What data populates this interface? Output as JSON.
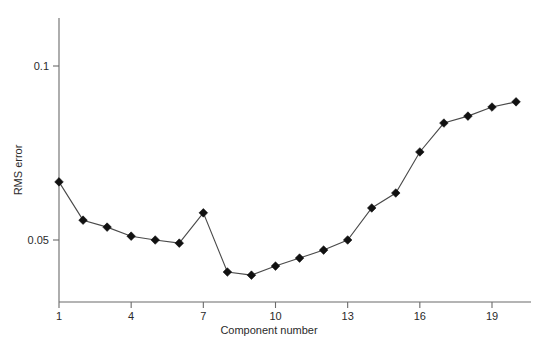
{
  "chart_data": {
    "type": "line",
    "title": "",
    "subtitle": "",
    "xlabel": "Component number",
    "ylabel": "RMS error",
    "x": [
      1,
      2,
      3,
      4,
      5,
      6,
      7,
      8,
      9,
      10,
      11,
      12,
      13,
      14,
      15,
      16,
      17,
      18,
      19,
      20
    ],
    "values": [
      0.0667,
      0.0557,
      0.0537,
      0.0511,
      0.05,
      0.0491,
      0.0578,
      0.0408,
      0.0399,
      0.0425,
      0.0448,
      0.0471,
      0.05,
      0.0592,
      0.0635,
      0.0753,
      0.0836,
      0.0856,
      0.0882,
      0.0897
    ],
    "series": [
      {
        "name": "RMS error",
        "values": [
          0.0667,
          0.0557,
          0.0537,
          0.0511,
          0.05,
          0.0491,
          0.0578,
          0.0408,
          0.0399,
          0.0425,
          0.0448,
          0.0471,
          0.05,
          0.0592,
          0.0635,
          0.0753,
          0.0836,
          0.0856,
          0.0882,
          0.0897
        ],
        "marker": "diamond",
        "color": "#111111"
      }
    ],
    "xticks": [
      1,
      4,
      7,
      10,
      13,
      16,
      19
    ],
    "xtick_labels": [
      "1",
      "4",
      "7",
      "10",
      "13",
      "16",
      "19"
    ],
    "yticks": [
      0.05,
      0.1
    ],
    "ytick_labels": [
      "0.05",
      "0.1"
    ],
    "xlim": [
      0.6,
      20.4
    ],
    "ylim": [
      0.0345,
      0.1095
    ],
    "grid": false,
    "legend": false,
    "legend_position": "none",
    "annotations": [],
    "line_color": "#4a4a4a",
    "marker_color": "#111111",
    "axis_color": "#6b6b6b",
    "background": "#ffffff"
  }
}
